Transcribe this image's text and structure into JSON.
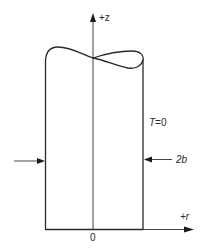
{
  "figure": {
    "type": "cylinder cross-section with twisted top",
    "axes": {
      "vertical_label": "+z",
      "horizontal_label": "+r",
      "origin_label": "0"
    },
    "annotations": {
      "temperature": "T=0",
      "width": "2b"
    },
    "colors": {
      "line": "#2a2a2a",
      "background": "#ffffff"
    }
  }
}
